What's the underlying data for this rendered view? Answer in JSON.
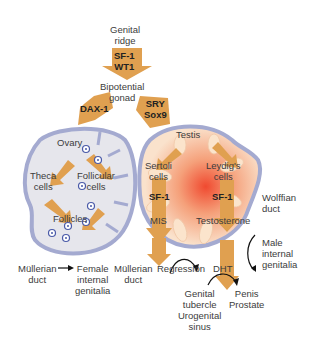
{
  "colors": {
    "arrow": "#e0a050",
    "ovary_fill": "#e4e4ea",
    "ovary_border": "#9aa0c8",
    "testis_center": "#f25a3a",
    "testis_tubule": "#f8dcc0",
    "follicle_ring": "#4a5aa8"
  },
  "nodes": {
    "genital_ridge": [
      "Genital",
      "ridge"
    ],
    "arrow1": [
      "SF-1",
      "WT1"
    ],
    "bipotential_gonad": [
      "Bipotential",
      "gonad"
    ],
    "dax1": "DAX-1",
    "sry_sox9": [
      "SRY",
      "Sox9"
    ],
    "ovary": "Ovary",
    "theca_cells": [
      "Theca",
      "cells"
    ],
    "follicular_cells": [
      "Follicular",
      "cells"
    ],
    "follicles": "Follicles",
    "testis": "Testis",
    "sertoli_cells": [
      "Sertoli",
      "cells"
    ],
    "leydig_cells": [
      "Leydig's",
      "cells"
    ],
    "sf1_left": "SF-1",
    "sf1_right": "SF-1",
    "mis": "MIS",
    "testosterone": "Testosterone",
    "wolffian_duct": [
      "Wolffian",
      "duct"
    ],
    "male_internal_genitalia": [
      "Male",
      "internal",
      "genitalia"
    ],
    "mullerian_duct_female": [
      "Müllerian",
      "duct"
    ],
    "female_internal_genitalia": [
      "Female",
      "internal",
      "genitalia"
    ],
    "mullerian_duct_male": [
      "Müllerian",
      "duct"
    ],
    "regression": "Regression",
    "dht": "DHT",
    "genital_tubercle": [
      "Genital",
      "tubercle",
      "Urogenital",
      "sinus"
    ],
    "penis_prostate": [
      "Penis",
      "Prostate"
    ]
  }
}
